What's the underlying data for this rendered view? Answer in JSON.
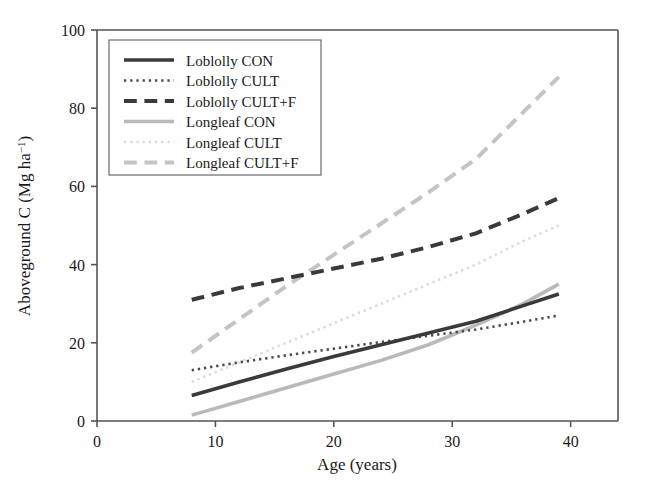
{
  "chart_data": {
    "type": "line",
    "title": "",
    "xlabel": "Age (years)",
    "ylabel": "Aboveground C (Mg ha⁻¹)",
    "ylabel_main": "Aboveground C (Mg ha",
    "ylabel_sup": "−1",
    "ylabel_tail": ")",
    "xlim": [
      0,
      44
    ],
    "ylim": [
      0,
      100
    ],
    "xticks": [
      0,
      10,
      20,
      30,
      40
    ],
    "xtick_labels": [
      "0",
      "10",
      "20",
      "30",
      "40"
    ],
    "yticks": [
      0,
      20,
      40,
      60,
      80,
      100
    ],
    "ytick_labels": [
      "0",
      "20",
      "40",
      "60",
      "80",
      "100"
    ],
    "grid": false,
    "legend_position": "upper-left-inside",
    "x": [
      8,
      12,
      16,
      20,
      24,
      28,
      32,
      36,
      39
    ],
    "series": [
      {
        "name": "Loblolly CON",
        "values": [
          6.5,
          10.0,
          13.3,
          16.5,
          19.5,
          22.5,
          25.5,
          29.5,
          32.5
        ],
        "color": "#3a3a3a",
        "style": "solid",
        "width": 3.6
      },
      {
        "name": "Loblolly CULT",
        "values": [
          13.0,
          15.0,
          16.8,
          18.5,
          20.2,
          21.8,
          23.4,
          25.4,
          27.0
        ],
        "color": "#4a4a4a",
        "style": "dotted",
        "width": 2.6
      },
      {
        "name": "Loblolly CULT+F",
        "values": [
          31.0,
          34.0,
          36.5,
          39.0,
          41.5,
          44.5,
          48.0,
          53.0,
          57.0
        ],
        "color": "#3a3a3a",
        "style": "dashed",
        "width": 4.0
      },
      {
        "name": "Longleaf CON",
        "values": [
          1.5,
          5.0,
          8.5,
          12.0,
          15.5,
          19.5,
          24.5,
          30.0,
          35.0
        ],
        "color": "#b9b9b9",
        "style": "solid",
        "width": 3.6
      },
      {
        "name": "Longleaf CULT",
        "values": [
          10.0,
          15.0,
          20.0,
          25.0,
          30.0,
          35.0,
          40.0,
          46.0,
          50.0
        ],
        "color": "#dadada",
        "style": "dotted",
        "width": 2.6
      },
      {
        "name": "Longleaf CULT+F",
        "values": [
          17.5,
          26.0,
          34.5,
          42.5,
          50.5,
          58.5,
          67.0,
          79.0,
          88.0
        ],
        "color": "#c4c4c4",
        "style": "dashed",
        "width": 4.0
      }
    ],
    "legend": [
      {
        "label": "Loblolly CON",
        "style": "solid",
        "color": "#3a3a3a"
      },
      {
        "label": "Loblolly CULT",
        "style": "dotted",
        "color": "#4a4a4a"
      },
      {
        "label": "Loblolly CULT+F",
        "style": "dashed",
        "color": "#3a3a3a"
      },
      {
        "label": "Longleaf CON",
        "style": "solid",
        "color": "#b9b9b9"
      },
      {
        "label": "Longleaf CULT",
        "style": "dotted",
        "color": "#dadada"
      },
      {
        "label": "Longleaf CULT+F",
        "style": "dashed",
        "color": "#c4c4c4"
      }
    ]
  }
}
